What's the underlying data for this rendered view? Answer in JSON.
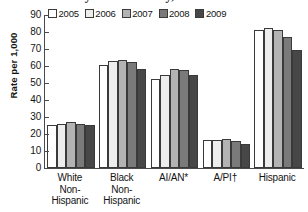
{
  "chart_data": {
    "type": "bar",
    "title": "by Race/Ethnicity, 2005-2009",
    "xlabel": "",
    "ylabel": "Rate per 1,000",
    "ylim": [
      0,
      90
    ],
    "yticks": [
      0,
      10,
      20,
      30,
      40,
      50,
      60,
      70,
      80,
      90
    ],
    "grid": false,
    "legend_position": "top-left",
    "categories": [
      "White Non-Hispanic",
      "Black Non-Hispanic",
      "AI/AN*",
      "A/PI†",
      "Hispanic"
    ],
    "category_lines": [
      [
        "White",
        "Non-",
        "Hispanic"
      ],
      [
        "Black",
        "Non-",
        "Hispanic"
      ],
      [
        "AI/AN*"
      ],
      [
        "A/PI†"
      ],
      [
        "Hispanic"
      ]
    ],
    "series": [
      {
        "name": "2005",
        "color": "#ffffff",
        "values": [
          25.3,
          60.6,
          52.4,
          16.5,
          81.1
        ]
      },
      {
        "name": "2006",
        "color": "#ededed",
        "values": [
          25.8,
          63.0,
          54.8,
          16.5,
          82.5
        ]
      },
      {
        "name": "2007",
        "color": "#b3b3b3",
        "values": [
          26.8,
          63.6,
          58.4,
          17.3,
          81.0
        ]
      },
      {
        "name": "2008",
        "color": "#7a7a7a",
        "values": [
          26.0,
          62.5,
          57.6,
          15.9,
          77.0
        ]
      },
      {
        "name": "2009",
        "color": "#474747",
        "values": [
          25.1,
          58.4,
          54.8,
          13.9,
          69.5
        ]
      }
    ]
  }
}
